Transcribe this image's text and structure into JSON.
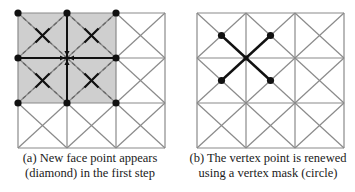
{
  "colors": {
    "grid": "#8a8a8a",
    "dark": "#111111",
    "shade": "#cfcfcf",
    "dashed": "#666666"
  },
  "grid": {
    "rows": 3,
    "cols": 3,
    "diagonals": "both"
  },
  "panels": [
    {
      "id": "a",
      "caption": {
        "line1": "(a) New face point appears",
        "line2": "(diamond) in the first step"
      },
      "shaded_cells": [
        [
          0,
          0
        ],
        [
          0,
          1
        ],
        [
          1,
          0
        ],
        [
          1,
          1
        ]
      ],
      "vertex_dots": [
        [
          0,
          0
        ],
        [
          0,
          1
        ],
        [
          0,
          2
        ],
        [
          1,
          0
        ],
        [
          1,
          2
        ],
        [
          2,
          0
        ],
        [
          2,
          1
        ],
        [
          2,
          2
        ]
      ],
      "center_vertex": [
        1,
        1
      ],
      "face_points": [
        [
          0,
          0
        ],
        [
          0,
          1
        ],
        [
          1,
          0
        ],
        [
          1,
          1
        ]
      ]
    },
    {
      "id": "b",
      "caption": {
        "line1": "(b) The vertex point is renewed",
        "line2": "using a vertex mask (circle)"
      },
      "center_vertex": [
        1,
        1
      ],
      "face_dots": [
        [
          0,
          0
        ],
        [
          0,
          1
        ],
        [
          1,
          0
        ],
        [
          1,
          1
        ]
      ]
    }
  ]
}
